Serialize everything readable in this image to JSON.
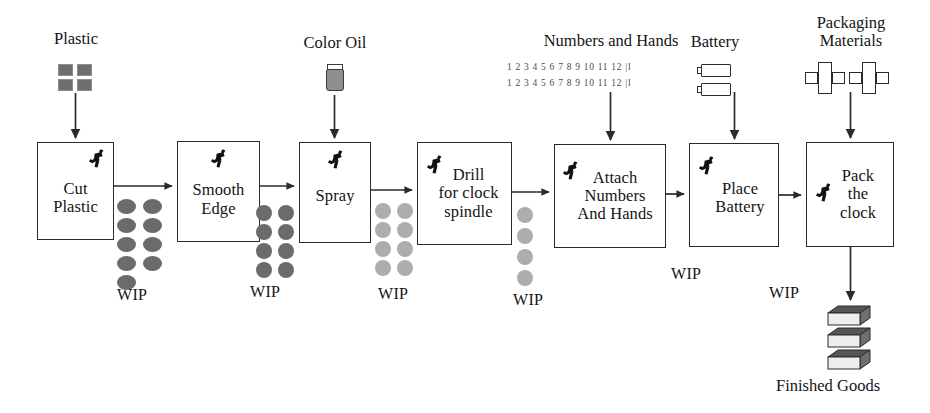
{
  "diagram": {
    "colors": {
      "line": "#2b2b2b",
      "box_border": "#2b2b2b",
      "wip_dark": "#6b6b6b",
      "wip_mid": "#7a7a7a",
      "wip_light": "#adadad",
      "plastic_square": "#6e6e6e",
      "jar_fill": "#8e8e8e",
      "fg_top": "#555555",
      "fg_side": "#6f6f6f",
      "fg_front": "#eeeeee",
      "text": "#141414"
    }
  },
  "processes": [
    {
      "id": "cut-plastic",
      "label": "Cut\nPlastic",
      "x": 37,
      "y": 142,
      "w": 77,
      "h": 98
    },
    {
      "id": "smooth-edge",
      "label": "Smooth\nEdge",
      "x": 177,
      "y": 141,
      "w": 83,
      "h": 101
    },
    {
      "id": "spray",
      "label": "Spray",
      "x": 299,
      "y": 142,
      "w": 72,
      "h": 101
    },
    {
      "id": "drill",
      "label": "Drill\nfor clock\nspindle",
      "x": 417,
      "y": 142,
      "w": 95,
      "h": 103
    },
    {
      "id": "attach",
      "label": "Attach\nNumbers\nAnd Hands",
      "x": 554,
      "y": 144,
      "w": 112,
      "h": 104
    },
    {
      "id": "place-battery",
      "label": "Place\nBattery",
      "x": 689,
      "y": 143,
      "w": 90,
      "h": 104
    },
    {
      "id": "pack",
      "label": "Pack\nthe\nclock",
      "x": 806,
      "y": 142,
      "w": 88,
      "h": 105
    }
  ],
  "materials": [
    {
      "id": "plastic",
      "label": "Plastic",
      "x": 56,
      "y": 30
    },
    {
      "id": "color-oil",
      "label": "Color Oil",
      "x": 297,
      "y": 34
    },
    {
      "id": "numbers",
      "label": "Numbers and Hands",
      "x": 495,
      "y": 32
    },
    {
      "id": "battery",
      "label": "Battery",
      "x": 682,
      "y": 33
    },
    {
      "id": "packaging",
      "label": "Packaging\nMaterials",
      "x": 800,
      "y": 14
    }
  ],
  "numbers_strip": {
    "line1": "1 2 3 4 5 6 7 8 9 10 11 12  |l",
    "line2": "1 2 3 4 5 6 7 8 9 10 11 12  |l"
  },
  "wip": [
    {
      "id": "wip-1",
      "label": "WIP",
      "count": 9,
      "shape": "ellipse",
      "tone": "dark",
      "label_x": 117,
      "label_y": 286
    },
    {
      "id": "wip-2",
      "label": "WIP",
      "count": 8,
      "shape": "circle",
      "tone": "dark",
      "label_x": 250,
      "label_y": 283
    },
    {
      "id": "wip-3",
      "label": "WIP",
      "count": 8,
      "shape": "circle",
      "tone": "light",
      "label_x": 378,
      "label_y": 285
    },
    {
      "id": "wip-4",
      "label": "WIP",
      "count": 4,
      "shape": "circle",
      "tone": "light",
      "label_x": 513,
      "label_y": 291
    },
    {
      "id": "wip-5",
      "label": "WIP",
      "count": 0,
      "shape": "none",
      "tone": "none",
      "label_x": 671,
      "label_y": 265
    },
    {
      "id": "wip-6",
      "label": "WIP",
      "count": 0,
      "shape": "none",
      "tone": "none",
      "label_x": 769,
      "label_y": 284
    }
  ],
  "finished_goods": {
    "label": "Finished Goods",
    "label_x": 776,
    "label_y": 376,
    "box_count": 3
  },
  "icons": {
    "worker": "worker-icon",
    "jar": "paint-jar-icon",
    "battery": "battery-icon",
    "package": "unfolded-box-icon",
    "plastic": "plastic-sheet-icon",
    "finished_box": "carton-icon",
    "arrow": "arrow-icon"
  }
}
